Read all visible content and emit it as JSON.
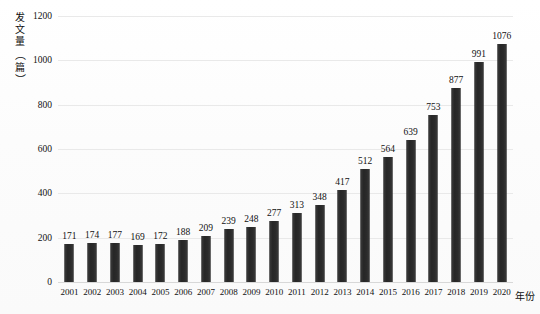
{
  "chart_data": {
    "type": "bar",
    "title": "",
    "subtitle": "",
    "xlabel": "年份",
    "ylabel": "发文量（篇）",
    "ylabel_chars": [
      "发",
      "文",
      "量",
      "（",
      "篇",
      "）"
    ],
    "categories": [
      "2001",
      "2002",
      "2003",
      "2004",
      "2005",
      "2006",
      "2007",
      "2008",
      "2009",
      "2010",
      "2011",
      "2012",
      "2013",
      "2014",
      "2015",
      "2016",
      "2017",
      "2018",
      "2019",
      "2020"
    ],
    "values": [
      171,
      174,
      177,
      169,
      172,
      188,
      209,
      239,
      248,
      277,
      313,
      348,
      417,
      512,
      564,
      639,
      753,
      877,
      991,
      1076
    ],
    "value_labels": [
      "171",
      "174",
      "177",
      "169",
      "172",
      "188",
      "209",
      "239",
      "248",
      "277",
      "313",
      "348",
      "417",
      "512",
      "564",
      "639",
      "753",
      "877",
      "991",
      "1076"
    ],
    "ylim": [
      0,
      1200
    ],
    "yticks": [
      0,
      200,
      400,
      600,
      800,
      1000,
      1200
    ],
    "ytick_labels": [
      "0",
      "200",
      "400",
      "600",
      "800",
      "1000",
      "1200"
    ],
    "grid": true,
    "grid_axis": "y",
    "legend": false,
    "legend_position": "none",
    "bar_color": "#2e2e2e",
    "grid_color": "#e9e9e9",
    "background_color": "#fdfdfd",
    "text_color": "#111111",
    "data_labels_shown": true
  }
}
